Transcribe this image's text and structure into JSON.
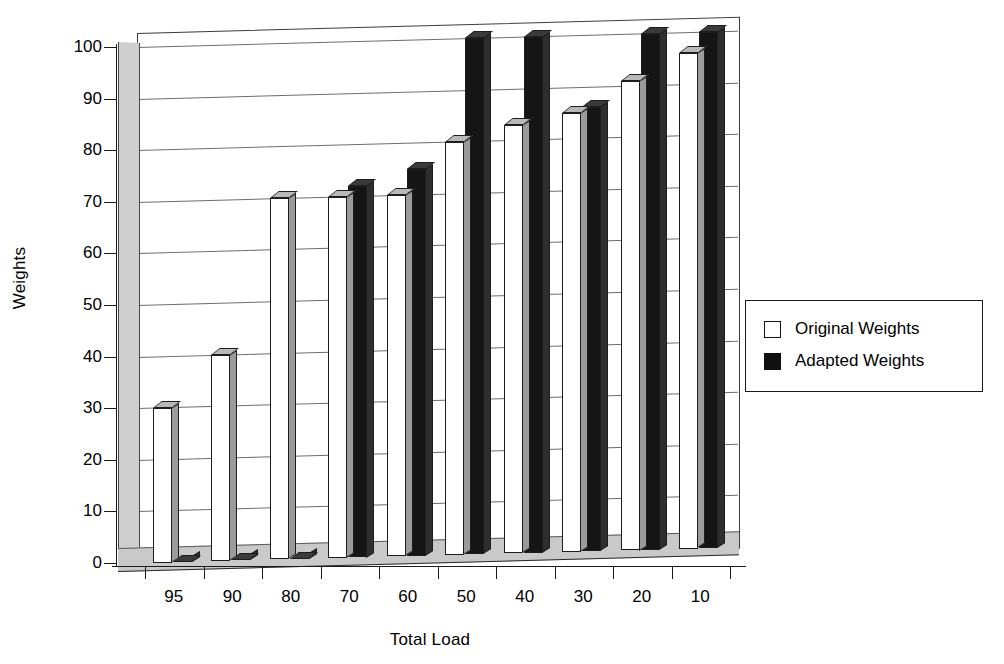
{
  "chart_data": {
    "type": "bar",
    "title": "",
    "xlabel": "Total Load",
    "ylabel": "Weights",
    "categories": [
      "95",
      "90",
      "80",
      "70",
      "60",
      "50",
      "40",
      "30",
      "20",
      "10"
    ],
    "series": [
      {
        "name": "Original Weights",
        "color": "#ffffff",
        "values": [
          30,
          40,
          70,
          70,
          70,
          80,
          83,
          85,
          91,
          96
        ]
      },
      {
        "name": "Adapted Weights",
        "color": "#101010",
        "values": [
          0,
          0,
          0,
          72,
          75,
          100,
          100,
          86,
          100,
          100
        ]
      }
    ],
    "ylim": [
      0,
      100
    ],
    "yticks": [
      0,
      10,
      20,
      30,
      40,
      50,
      60,
      70,
      80,
      90,
      100
    ],
    "ytick_labels": [
      "0",
      "10",
      "20",
      "30",
      "40",
      "50",
      "60",
      "70",
      "80",
      "90",
      "100"
    ],
    "grid": true,
    "grid_axis": "y",
    "legend_position": "right",
    "style": "3d-column"
  },
  "legend": {
    "items": [
      {
        "label": "Original Weights",
        "swatch": "white-square-swatch"
      },
      {
        "label": "Adapted Weights",
        "swatch": "black-square-swatch"
      }
    ]
  },
  "axes": {
    "y_title": "Weights",
    "x_title": "Total Load"
  },
  "colors": {
    "background": "#ffffff",
    "axis": "#1a1a1a",
    "gridline": "#6d6d6d",
    "wall": "#cfcfcf",
    "floor": "#c9c9c9",
    "original_fill": "#ffffff",
    "adapted_fill": "#151515"
  }
}
